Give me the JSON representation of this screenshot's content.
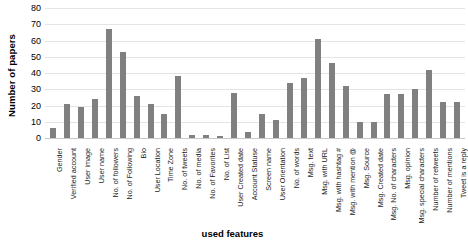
{
  "chart_data": {
    "type": "bar",
    "title": "",
    "xlabel": "used features",
    "ylabel": "Number of papers",
    "ylim": [
      0,
      80
    ],
    "yticks": [
      0,
      10,
      20,
      30,
      40,
      50,
      60,
      70,
      80
    ],
    "grid": true,
    "legend": false,
    "bar_color": "#808080",
    "gridline_color": "#e4e4e4",
    "categories": [
      "Gender",
      "Verified account",
      "User image",
      "User name",
      "No. of followers",
      "No. of Following",
      "Bio",
      "User Location",
      "Time Zone",
      "No. of tweets",
      "No. of media",
      "No. of Favorites",
      "No. of List",
      "User Created date",
      "Account Statuse",
      "Screen name",
      "User Orientation",
      "No. of words",
      "Msg. text",
      "Msg. with URL",
      "Msg. with hashtag #",
      "Msg. with mention @",
      "Msg. Source",
      "Msg. Created date",
      "Msg. No. of characters",
      "Msg. opinion",
      "Msg. special characters",
      "Number of retweets",
      "Number of mentions",
      "Tweet is a reply"
    ],
    "values": [
      6,
      21,
      19,
      24,
      67,
      53,
      26,
      21,
      15,
      38,
      2,
      2,
      1,
      28,
      4,
      15,
      11,
      34,
      37,
      61,
      46,
      32,
      10,
      10,
      27,
      27,
      30,
      42,
      22,
      22
    ]
  }
}
